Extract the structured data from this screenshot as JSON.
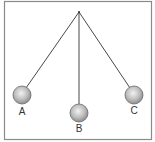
{
  "diagram": {
    "type": "pendulum-positions",
    "frame": {
      "x": 4,
      "y": 1,
      "width": 148,
      "height": 139,
      "stroke": "#8a8a8a"
    },
    "pivot": {
      "x": 79,
      "y": 12
    },
    "string_color": "#333333",
    "bob_radius": 9,
    "bobs": [
      {
        "label": "A",
        "x": 22,
        "y": 95,
        "label_y": 112
      },
      {
        "label": "B",
        "x": 79,
        "y": 113,
        "label_y": 130
      },
      {
        "label": "C",
        "x": 134,
        "y": 95,
        "label_y": 112
      }
    ]
  }
}
